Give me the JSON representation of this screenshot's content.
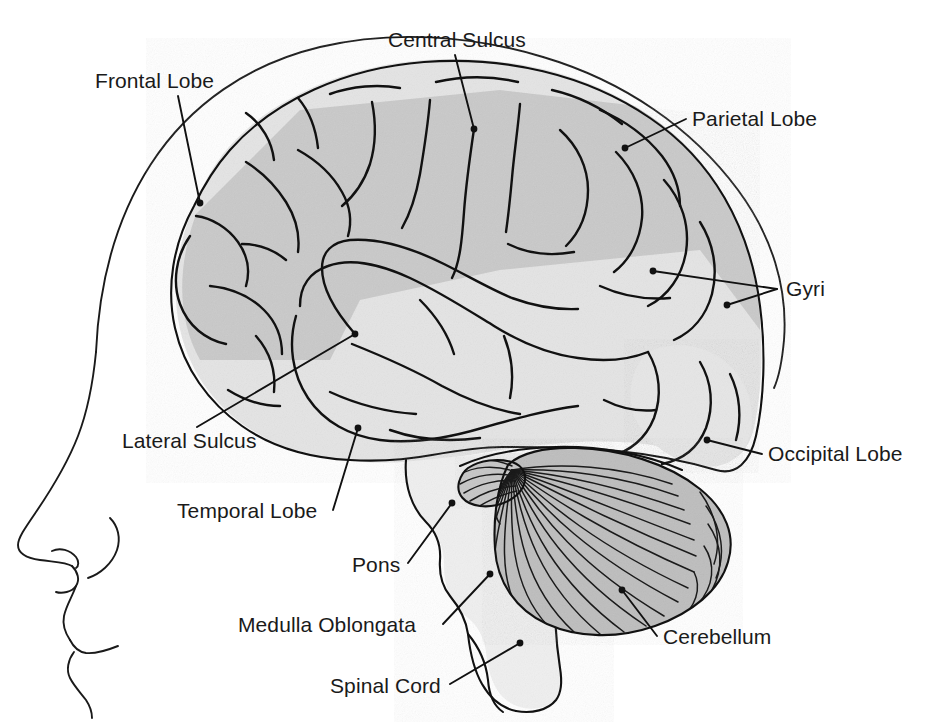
{
  "figure": {
    "view": "left lateral (sagittal profile, facing left)",
    "style": "black-and-white line drawing with gray shading"
  },
  "colors": {
    "background": "#ffffff",
    "outline": "#111111",
    "cerebrum_upper_fill": "#c9c9c9",
    "cerebrum_lower_fill": "#e3e3e3",
    "cerebellum_fill": "#b9b9b9",
    "brainstem_fill": "#eeeeee",
    "text": "#1a1a1a"
  },
  "labels": [
    {
      "id": "frontal-lobe",
      "text": "Frontal Lobe",
      "text_x": 95,
      "text_y": 88,
      "anchor": "start",
      "target_x": 200,
      "target_y": 203,
      "leader": "M 178 96 L 200 203"
    },
    {
      "id": "central-sulcus",
      "text": "Central Sulcus",
      "text_x": 388,
      "text_y": 47,
      "anchor": "start",
      "target_x": 474,
      "target_y": 129,
      "leader": "M 455 55 L 474 129"
    },
    {
      "id": "parietal-lobe",
      "text": "Parietal Lobe",
      "text_x": 692,
      "text_y": 126,
      "anchor": "start",
      "target_x": 625,
      "target_y": 148,
      "leader": "M 686 119 L 625 148"
    },
    {
      "id": "gyri",
      "text": "Gyri",
      "text_x": 786,
      "text_y": 296,
      "anchor": "start",
      "target_x": 653,
      "target_y": 271,
      "target2_x": 727,
      "target2_y": 305,
      "leader": "M 777 289 L 653 271",
      "leader2": "M 777 289 L 727 305"
    },
    {
      "id": "occipital-lobe",
      "text": "Occipital Lobe",
      "text_x": 768,
      "text_y": 461,
      "anchor": "start",
      "target_x": 707,
      "target_y": 440,
      "leader": "M 762 454 L 707 440"
    },
    {
      "id": "lateral-sulcus",
      "text": "Lateral Sulcus",
      "text_x": 122,
      "text_y": 448,
      "anchor": "start",
      "target_x": 355,
      "target_y": 334,
      "leader": "M 197 427 L 355 334"
    },
    {
      "id": "temporal-lobe",
      "text": "Temporal Lobe",
      "text_x": 177,
      "text_y": 518,
      "anchor": "start",
      "target_x": 358,
      "target_y": 428,
      "leader": "M 333 510 L 358 428"
    },
    {
      "id": "pons",
      "text": "Pons",
      "text_x": 352,
      "text_y": 572,
      "anchor": "start",
      "target_x": 452,
      "target_y": 503,
      "leader": "M 408 563 L 452 503"
    },
    {
      "id": "medulla-oblongata",
      "text": "Medulla Oblongata",
      "text_x": 238,
      "text_y": 632,
      "anchor": "start",
      "target_x": 490,
      "target_y": 574,
      "leader": "M 443 624 L 490 574"
    },
    {
      "id": "spinal-cord",
      "text": "Spinal Cord",
      "text_x": 330,
      "text_y": 693,
      "anchor": "start",
      "target_x": 520,
      "target_y": 643,
      "leader": "M 450 684 L 520 643"
    },
    {
      "id": "cerebellum",
      "text": "Cerebellum",
      "text_x": 663,
      "text_y": 644,
      "anchor": "start",
      "target_x": 622,
      "target_y": 590,
      "leader": "M 657 636 L 622 590"
    }
  ]
}
